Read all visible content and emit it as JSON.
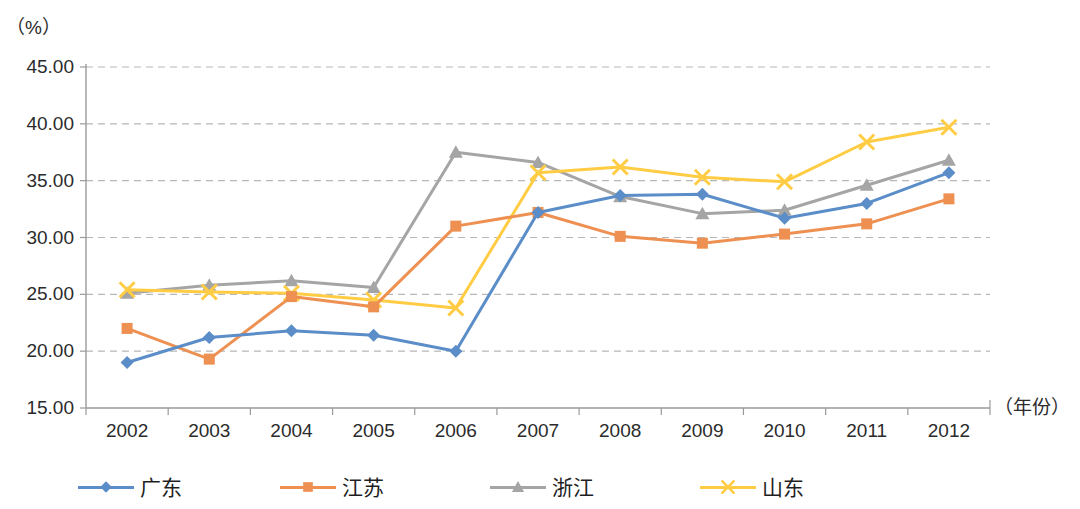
{
  "chart_data": {
    "type": "line",
    "title": "",
    "xlabel": "（年份）",
    "ylabel": "（%）",
    "x": [
      2002,
      2003,
      2004,
      2005,
      2006,
      2007,
      2008,
      2009,
      2010,
      2011,
      2012
    ],
    "categories": [
      "2002",
      "2003",
      "2004",
      "2005",
      "2006",
      "2007",
      "2008",
      "2009",
      "2010",
      "2011",
      "2012"
    ],
    "ylim": [
      15.0,
      45.0
    ],
    "ytick_labels": [
      "45.00",
      "40.00",
      "35.00",
      "30.00",
      "25.00",
      "20.00",
      "15.00"
    ],
    "yticks": [
      45.0,
      40.0,
      35.0,
      30.0,
      25.0,
      20.0,
      15.0
    ],
    "grid": "horizontal-dashed",
    "legend_position": "bottom",
    "series": [
      {
        "name": "广东",
        "color": "#5B8DC8",
        "marker": "diamond",
        "values": [
          19.0,
          21.2,
          21.8,
          21.4,
          20.0,
          32.2,
          33.7,
          33.8,
          31.7,
          33.0,
          35.7
        ]
      },
      {
        "name": "江苏",
        "color": "#ED9051",
        "marker": "square",
        "values": [
          22.0,
          19.3,
          24.8,
          23.9,
          31.0,
          32.2,
          30.1,
          29.5,
          30.3,
          31.2,
          33.4
        ]
      },
      {
        "name": "浙江",
        "color": "#A5A5A5",
        "marker": "triangle",
        "values": [
          25.1,
          25.8,
          26.2,
          25.6,
          37.5,
          36.6,
          33.6,
          32.1,
          32.4,
          34.6,
          36.8
        ]
      },
      {
        "name": "山东",
        "color": "#FFCC44",
        "marker": "cross",
        "values": [
          25.4,
          25.2,
          25.1,
          24.5,
          23.8,
          35.7,
          36.2,
          35.3,
          34.9,
          38.4,
          39.7
        ]
      }
    ]
  },
  "axes": {
    "y_unit": "（%）",
    "x_unit": "（年份）"
  },
  "colors": {
    "guangdong": "#5B8DC8",
    "jiangsu": "#ED9051",
    "zhejiang": "#A5A5A5",
    "shandong": "#FFCC44",
    "axis": "#9a9a9a",
    "grid": "#b7b7b7",
    "text": "#2b2b2b"
  }
}
